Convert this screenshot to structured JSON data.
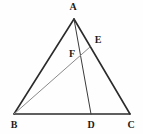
{
  "figure": {
    "kind": "geometry-diagram",
    "width": 143,
    "height": 134,
    "background_color": "#fefefe"
  },
  "colors": {
    "outline_stroke": "#2b2b2b",
    "cevian_ad_stroke": "#3a3a3a",
    "cevian_be_stroke": "#8a8a8a",
    "label_color": "#1c1c1c"
  },
  "points": [
    {
      "id": "A",
      "label": "A",
      "x": 74,
      "y": 19,
      "label_x": 73,
      "label_y": 7,
      "role": "apex-vertex"
    },
    {
      "id": "B",
      "label": "B",
      "x": 14,
      "y": 114,
      "label_x": 14,
      "label_y": 125,
      "role": "base-left-vertex"
    },
    {
      "id": "C",
      "label": "C",
      "x": 130,
      "y": 114,
      "label_x": 131,
      "label_y": 125,
      "role": "base-right-vertex"
    },
    {
      "id": "D",
      "label": "D",
      "x": 91,
      "y": 114,
      "label_x": 91,
      "label_y": 125,
      "role": "point-on-base-bc"
    },
    {
      "id": "E",
      "label": "E",
      "x": 90,
      "y": 47,
      "label_x": 98,
      "label_y": 40,
      "role": "point-on-side-ac"
    },
    {
      "id": "F",
      "label": "F",
      "x": 80,
      "y": 56,
      "label_x": 72,
      "label_y": 54,
      "role": "intersection-point"
    }
  ],
  "segments": [
    {
      "id": "AB",
      "from": "A",
      "to": "B",
      "name": "side-ab",
      "stroke": "#2b2b2b",
      "width": 1.6
    },
    {
      "id": "AC",
      "from": "A",
      "to": "C",
      "name": "side-ac",
      "stroke": "#2b2b2b",
      "width": 1.6
    },
    {
      "id": "BC",
      "from": "B",
      "to": "C",
      "name": "base-bc",
      "stroke": "#2b2b2b",
      "width": 1.6
    },
    {
      "id": "AD",
      "from": "A",
      "to": "D",
      "name": "cevian-ad",
      "stroke": "#3a3a3a",
      "width": 1.0
    },
    {
      "id": "BE",
      "from": "B",
      "to": "E",
      "name": "cevian-be",
      "stroke": "#8a8a8a",
      "width": 1.0
    }
  ]
}
